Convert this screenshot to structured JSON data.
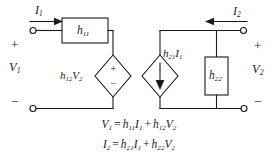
{
  "diagram": {
    "stroke_color": "#1a1a1a",
    "background": "#ffffff"
  },
  "ports": {
    "input_current": {
      "symbol": "I",
      "sub": "1",
      "direction": "right"
    },
    "output_current": {
      "symbol": "I",
      "sub": "2",
      "direction": "left"
    },
    "input_voltage": {
      "symbol": "V",
      "sub": "1"
    },
    "output_voltage": {
      "symbol": "V",
      "sub": "2"
    },
    "plus_sign": "+",
    "minus_sign": "−"
  },
  "elements": {
    "series_resistor": {
      "symbol": "h",
      "sub": "11"
    },
    "shunt_resistor": {
      "symbol": "h",
      "sub": "22"
    },
    "voltage_source": {
      "symbol": "h",
      "sub": "12",
      "factor": "V",
      "factor_sub": "2",
      "plus": "+",
      "minus": "−"
    },
    "current_source": {
      "symbol": "h",
      "sub": "21",
      "factor": "I",
      "factor_sub": "1"
    }
  },
  "equations": [
    {
      "lhs": "V",
      "lhs_sub": "1",
      "eq": "=",
      "t1_coef": "h",
      "t1_coef_sub": "11",
      "t1_var": "I",
      "t1_var_sub": "1",
      "plus": "+",
      "t2_coef": "h",
      "t2_coef_sub": "12",
      "t2_var": "V",
      "t2_var_sub": "2"
    },
    {
      "lhs": "I",
      "lhs_sub": "2",
      "eq": "=",
      "t1_coef": "h",
      "t1_coef_sub": "21",
      "t1_var": "I",
      "t1_var_sub": "1",
      "plus": "+",
      "t2_coef": "h",
      "t2_coef_sub": "22",
      "t2_var": "V",
      "t2_var_sub": "2"
    }
  ]
}
